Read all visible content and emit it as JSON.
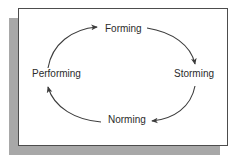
{
  "diagram": {
    "shape": "ellipse-cycle",
    "direction": "clockwise",
    "frame": {
      "background_color": "#ffffff",
      "border_color": "#4d4d4d",
      "shadow_color": "#a8a8a8"
    },
    "stroke_color": "#3c3c3c",
    "text_color": "#2b2b2b",
    "nodes": [
      {
        "id": "forming",
        "label": "Forming",
        "position": "top"
      },
      {
        "id": "storming",
        "label": "Storming",
        "position": "right"
      },
      {
        "id": "norming",
        "label": "Norming",
        "position": "bottom"
      },
      {
        "id": "performing",
        "label": "Performing",
        "position": "left"
      }
    ],
    "arrows": [
      {
        "from": "forming",
        "to": "storming",
        "arrowhead": "down"
      },
      {
        "from": "storming",
        "to": "norming",
        "arrowhead": "left"
      },
      {
        "from": "norming",
        "to": "performing",
        "arrowhead": "up"
      },
      {
        "from": "performing",
        "to": "forming",
        "arrowhead": "right"
      }
    ]
  }
}
